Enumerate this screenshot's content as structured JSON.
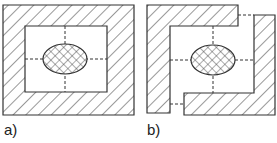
{
  "figure": {
    "panels": [
      {
        "id": "a",
        "label": "a)",
        "description": "Closed hatched frame enclosing a cross-hatched elliptical core with dashed center lines"
      },
      {
        "id": "b",
        "label": "b)",
        "description": "Two interlocking hatched L/C-shaped pieces with gaps, enclosing a cross-hatched elliptical core with dashed center lines"
      }
    ]
  },
  "colors": {
    "stroke": "#333333",
    "hatch": "#444444",
    "background": "#ffffff"
  }
}
